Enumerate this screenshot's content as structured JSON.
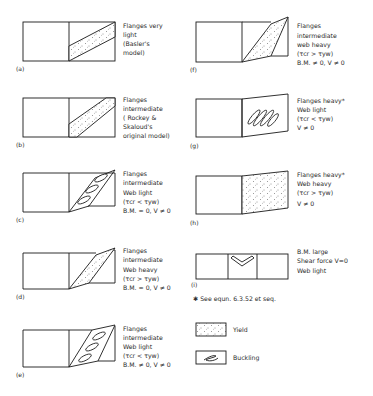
{
  "panels": [
    {
      "id": "a",
      "tag": "(a)",
      "lines": [
        "Flanges very",
        "light",
        "(Basler's",
        "  model)"
      ]
    },
    {
      "id": "b",
      "tag": "(b)",
      "lines": [
        "Flanges",
        "intermediate",
        "( Rockey &",
        "  Skaloud's",
        "original model)"
      ]
    },
    {
      "id": "c",
      "tag": "(c)",
      "lines": [
        "Flanges",
        "intermediate",
        "Web light",
        "(τcr < τyw)",
        "B.M. = 0, V ≠ 0"
      ]
    },
    {
      "id": "d",
      "tag": "(d)",
      "lines": [
        "Flanges",
        "intermediate",
        "Web heavy",
        "(τcr > τyw)",
        "B.M. = 0, V ≠ 0"
      ]
    },
    {
      "id": "e",
      "tag": "(e)",
      "lines": [
        "Flanges",
        "intermediate",
        "Web light",
        "(τcr < τyw)",
        "B.M. ≠ 0, V ≠ 0"
      ]
    },
    {
      "id": "f",
      "tag": "(f)",
      "lines": [
        "Flanges",
        "intermediate",
        "web heavy",
        "(τcr > τyw)",
        "B.M. ≠ 0, V ≠ 0"
      ]
    },
    {
      "id": "g",
      "tag": "(g)",
      "lines": [
        "Flanges heavy*",
        "Web light",
        "(τcr < τyw)",
        "V ≠ 0"
      ]
    },
    {
      "id": "h",
      "tag": "(h)",
      "lines": [
        "Flanges heavy*",
        "Web heavy",
        "(τcr > τyw)",
        "V ≠ 0"
      ]
    },
    {
      "id": "i",
      "tag": "(i)",
      "lines": [
        "B.M. large",
        "Shear force V=0",
        "Web light"
      ]
    }
  ],
  "footnote": "✱  See equn. 6.3.52 et seq.",
  "legend": [
    {
      "id": "yield",
      "label": "Yield",
      "pattern": "dots"
    },
    {
      "id": "buckling",
      "label": "Buckling",
      "pattern": "buckle-wave"
    }
  ],
  "colors": {
    "ink": "#1a1a1a",
    "background": "#ffffff"
  }
}
